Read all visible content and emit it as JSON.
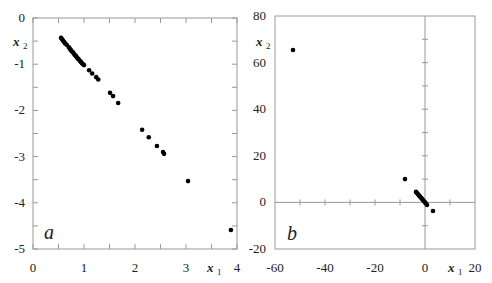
{
  "chart_data": [
    {
      "type": "scatter",
      "panel_label": "a",
      "xlabel": "x",
      "xlabel_sub": "1",
      "ylabel": "x",
      "ylabel_sub": "2",
      "xlim": [
        0,
        4
      ],
      "ylim": [
        -5,
        0
      ],
      "xticks": [
        "0",
        "1",
        "2",
        "3",
        "4"
      ],
      "yticks": [
        "0",
        "-1",
        "-2",
        "-3",
        "-4",
        "-5"
      ],
      "grid": false,
      "points": [
        [
          0.55,
          -0.43
        ],
        [
          0.57,
          -0.46
        ],
        [
          0.59,
          -0.49
        ],
        [
          0.61,
          -0.52
        ],
        [
          0.63,
          -0.55
        ],
        [
          0.66,
          -0.58
        ],
        [
          0.7,
          -0.63
        ],
        [
          0.72,
          -0.66
        ],
        [
          0.74,
          -0.69
        ],
        [
          0.76,
          -0.72
        ],
        [
          0.78,
          -0.74
        ],
        [
          0.8,
          -0.77
        ],
        [
          0.82,
          -0.8
        ],
        [
          0.84,
          -0.82
        ],
        [
          0.86,
          -0.85
        ],
        [
          0.88,
          -0.88
        ],
        [
          0.9,
          -0.9
        ],
        [
          0.92,
          -0.93
        ],
        [
          0.94,
          -0.95
        ],
        [
          0.96,
          -0.98
        ],
        [
          0.98,
          -1.0
        ],
        [
          1.0,
          -1.02
        ],
        [
          1.1,
          -1.13
        ],
        [
          1.16,
          -1.2
        ],
        [
          1.24,
          -1.28
        ],
        [
          1.28,
          -1.33
        ],
        [
          1.51,
          -1.62
        ],
        [
          1.57,
          -1.69
        ],
        [
          1.67,
          -1.84
        ],
        [
          2.14,
          -2.42
        ],
        [
          2.27,
          -2.58
        ],
        [
          2.43,
          -2.77
        ],
        [
          2.55,
          -2.9
        ],
        [
          2.57,
          -2.94
        ],
        [
          3.04,
          -3.53
        ],
        [
          3.88,
          -4.59
        ]
      ]
    },
    {
      "type": "scatter",
      "panel_label": "b",
      "xlabel": "x",
      "xlabel_sub": "1",
      "ylabel": "x",
      "ylabel_sub": "2",
      "xlim": [
        -60,
        20
      ],
      "ylim": [
        -20,
        80
      ],
      "xticks": [
        "-60",
        "-40",
        "-20",
        "0",
        "20"
      ],
      "yticks": [
        "80",
        "60",
        "40",
        "20",
        "0",
        "-20"
      ],
      "grid": false,
      "axes_through_origin": true,
      "points": [
        [
          -52.8,
          65.4
        ],
        [
          -8.0,
          10.0
        ],
        [
          -3.6,
          4.5
        ],
        [
          -3.2,
          4.0
        ],
        [
          -2.8,
          3.5
        ],
        [
          -2.4,
          3.0
        ],
        [
          -2.0,
          2.5
        ],
        [
          -1.6,
          2.0
        ],
        [
          -1.2,
          1.5
        ],
        [
          -0.8,
          1.0
        ],
        [
          -0.4,
          0.5
        ],
        [
          0.0,
          0.0
        ],
        [
          0.4,
          -0.5
        ],
        [
          0.8,
          -1.1
        ],
        [
          3.2,
          -3.7
        ]
      ]
    }
  ]
}
